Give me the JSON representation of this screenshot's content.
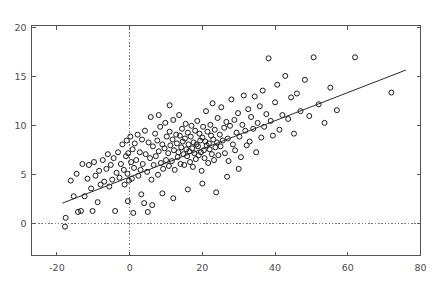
{
  "chart_data": {
    "type": "scatter",
    "title": "",
    "subtitle": "",
    "xlabel": "",
    "ylabel": "",
    "xlim": [
      -27,
      80
    ],
    "ylim": [
      -3.3,
      20.2
    ],
    "xticks": [
      -20,
      0,
      20,
      40,
      60,
      80
    ],
    "yticks": [
      0,
      5,
      10,
      15,
      20
    ],
    "xtick_labels": [
      "-20",
      "0",
      "20",
      "40",
      "60",
      "80"
    ],
    "ytick_labels": [
      "0",
      "5",
      "10",
      "15",
      "20"
    ],
    "grid": false,
    "legend": null,
    "legend_position": "none",
    "marker_style": "open-circle",
    "marker_color": "#1a1a1a",
    "background_color": "#ffffff",
    "axis_color": "#555555",
    "reference_lines": [
      {
        "name": "x-zero-line",
        "orientation": "vertical",
        "value": 0,
        "style": "dotted",
        "color": "#777777"
      },
      {
        "name": "y-zero-line",
        "orientation": "horizontal",
        "value": 0,
        "style": "dotted",
        "color": "#777777"
      }
    ],
    "fit_line": {
      "name": "regression-line",
      "x": [
        -18.5,
        76.0
      ],
      "y": [
        2.05,
        15.65
      ],
      "slope": 0.1438,
      "intercept": 4.71,
      "color": "#2b2b2b"
    },
    "points": [
      [
        -17.8,
        -0.35
      ],
      [
        -17.6,
        0.55
      ],
      [
        -16.2,
        4.35
      ],
      [
        -15.4,
        2.75
      ],
      [
        -14.6,
        5.05
      ],
      [
        -14.2,
        1.15
      ],
      [
        -13.4,
        1.25
      ],
      [
        -13.0,
        6.05
      ],
      [
        -12.4,
        2.75
      ],
      [
        -11.6,
        4.55
      ],
      [
        -11.2,
        5.95
      ],
      [
        -10.6,
        3.55
      ],
      [
        -10.2,
        1.25
      ],
      [
        -9.8,
        6.25
      ],
      [
        -9.4,
        4.85
      ],
      [
        -8.8,
        2.15
      ],
      [
        -8.4,
        5.35
      ],
      [
        -8.0,
        3.95
      ],
      [
        -7.4,
        6.45
      ],
      [
        -7.0,
        4.25
      ],
      [
        -6.4,
        5.55
      ],
      [
        -6.0,
        7.05
      ],
      [
        -5.6,
        3.75
      ],
      [
        -5.2,
        5.95
      ],
      [
        -4.8,
        4.45
      ],
      [
        -4.4,
        6.65
      ],
      [
        -4.0,
        1.25
      ],
      [
        -3.6,
        5.15
      ],
      [
        -3.2,
        7.25
      ],
      [
        -2.8,
        4.65
      ],
      [
        -2.4,
        6.05
      ],
      [
        -2.0,
        8.05
      ],
      [
        -1.6,
        5.45
      ],
      [
        -1.4,
        3.95
      ],
      [
        -1.0,
        6.85
      ],
      [
        -0.8,
        8.45
      ],
      [
        -0.6,
        5.05
      ],
      [
        -0.4,
        7.15
      ],
      [
        -0.2,
        4.35
      ],
      [
        0.2,
        8.85
      ],
      [
        0.4,
        6.25
      ],
      [
        0.6,
        4.55
      ],
      [
        0.8,
        7.55
      ],
      [
        1.2,
        5.65
      ],
      [
        1.4,
        8.15
      ],
      [
        1.8,
        6.45
      ],
      [
        2.2,
        9.05
      ],
      [
        2.4,
        4.85
      ],
      [
        2.8,
        7.25
      ],
      [
        3.0,
        5.45
      ],
      [
        3.4,
        8.55
      ],
      [
        3.6,
        6.05
      ],
      [
        4.0,
        2.05
      ],
      [
        4.2,
        9.45
      ],
      [
        4.4,
        7.05
      ],
      [
        4.8,
        5.25
      ],
      [
        5.0,
        1.15
      ],
      [
        5.2,
        8.25
      ],
      [
        5.6,
        6.65
      ],
      [
        5.8,
        10.85
      ],
      [
        6.0,
        4.45
      ],
      [
        6.4,
        7.85
      ],
      [
        6.6,
        5.95
      ],
      [
        7.0,
        9.15
      ],
      [
        7.2,
        6.85
      ],
      [
        7.6,
        8.45
      ],
      [
        7.8,
        4.95
      ],
      [
        8.0,
        7.35
      ],
      [
        8.4,
        9.85
      ],
      [
        8.6,
        6.15
      ],
      [
        9.0,
        8.05
      ],
      [
        9.2,
        5.55
      ],
      [
        9.6,
        7.65
      ],
      [
        9.8,
        10.25
      ],
      [
        10.0,
        6.45
      ],
      [
        10.2,
        8.85
      ],
      [
        10.6,
        7.15
      ],
      [
        10.8,
        5.85
      ],
      [
        11.0,
        9.35
      ],
      [
        11.2,
        7.95
      ],
      [
        11.6,
        6.35
      ],
      [
        11.8,
        8.55
      ],
      [
        12.0,
        10.55
      ],
      [
        12.2,
        7.45
      ],
      [
        12.4,
        5.45
      ],
      [
        12.8,
        9.05
      ],
      [
        13.0,
        8.15
      ],
      [
        13.2,
        6.75
      ],
      [
        13.4,
        7.25
      ],
      [
        13.6,
        11.05
      ],
      [
        13.8,
        8.95
      ],
      [
        14.0,
        6.05
      ],
      [
        14.2,
        7.75
      ],
      [
        14.4,
        9.65
      ],
      [
        14.6,
        8.35
      ],
      [
        14.8,
        7.05
      ],
      [
        15.0,
        5.95
      ],
      [
        15.2,
        8.65
      ],
      [
        15.4,
        10.15
      ],
      [
        15.6,
        7.55
      ],
      [
        15.8,
        6.85
      ],
      [
        16.0,
        9.25
      ],
      [
        16.2,
        8.05
      ],
      [
        16.4,
        7.35
      ],
      [
        16.6,
        6.25
      ],
      [
        16.8,
        8.85
      ],
      [
        17.0,
        9.95
      ],
      [
        17.2,
        7.65
      ],
      [
        17.4,
        5.75
      ],
      [
        17.6,
        8.25
      ],
      [
        17.8,
        7.15
      ],
      [
        18.0,
        9.45
      ],
      [
        18.2,
        6.55
      ],
      [
        18.4,
        8.05
      ],
      [
        18.6,
        10.45
      ],
      [
        18.8,
        7.85
      ],
      [
        19.0,
        6.95
      ],
      [
        19.2,
        9.15
      ],
      [
        19.4,
        8.45
      ],
      [
        19.6,
        7.25
      ],
      [
        19.8,
        5.35
      ],
      [
        20.0,
        8.75
      ],
      [
        20.2,
        9.85
      ],
      [
        20.4,
        7.45
      ],
      [
        20.6,
        6.65
      ],
      [
        20.8,
        8.35
      ],
      [
        21.0,
        11.45
      ],
      [
        21.2,
        7.95
      ],
      [
        21.4,
        9.35
      ],
      [
        21.6,
        6.15
      ],
      [
        21.8,
        8.15
      ],
      [
        22.0,
        7.55
      ],
      [
        22.2,
        10.05
      ],
      [
        22.4,
        8.95
      ],
      [
        22.6,
        7.05
      ],
      [
        22.8,
        12.25
      ],
      [
        23.0,
        8.55
      ],
      [
        23.2,
        6.45
      ],
      [
        23.4,
        9.55
      ],
      [
        23.6,
        7.75
      ],
      [
        24.0,
        8.25
      ],
      [
        24.2,
        10.75
      ],
      [
        24.4,
        6.95
      ],
      [
        24.8,
        9.05
      ],
      [
        25.0,
        7.85
      ],
      [
        25.2,
        11.85
      ],
      [
        25.6,
        8.45
      ],
      [
        26.0,
        9.75
      ],
      [
        26.2,
        7.15
      ],
      [
        26.6,
        10.35
      ],
      [
        27.0,
        8.65
      ],
      [
        27.2,
        6.35
      ],
      [
        27.6,
        9.95
      ],
      [
        28.0,
        12.65
      ],
      [
        28.4,
        8.05
      ],
      [
        28.8,
        10.55
      ],
      [
        29.0,
        7.45
      ],
      [
        29.4,
        9.25
      ],
      [
        29.8,
        11.25
      ],
      [
        30.2,
        8.85
      ],
      [
        30.6,
        6.75
      ],
      [
        31.0,
        10.05
      ],
      [
        31.4,
        13.05
      ],
      [
        31.8,
        9.45
      ],
      [
        32.2,
        7.95
      ],
      [
        32.6,
        11.65
      ],
      [
        33.0,
        8.35
      ],
      [
        33.4,
        10.85
      ],
      [
        34.0,
        9.65
      ],
      [
        34.4,
        12.95
      ],
      [
        34.8,
        7.25
      ],
      [
        35.2,
        10.25
      ],
      [
        35.8,
        11.95
      ],
      [
        36.2,
        8.75
      ],
      [
        36.6,
        13.55
      ],
      [
        37.0,
        9.85
      ],
      [
        37.6,
        11.15
      ],
      [
        38.2,
        16.85
      ],
      [
        38.8,
        10.45
      ],
      [
        39.4,
        8.95
      ],
      [
        40.0,
        12.35
      ],
      [
        40.6,
        14.15
      ],
      [
        41.2,
        9.55
      ],
      [
        42.0,
        11.05
      ],
      [
        42.8,
        15.05
      ],
      [
        43.6,
        10.65
      ],
      [
        44.4,
        12.85
      ],
      [
        45.2,
        9.15
      ],
      [
        46.0,
        13.25
      ],
      [
        47.0,
        11.45
      ],
      [
        48.2,
        14.65
      ],
      [
        49.4,
        10.95
      ],
      [
        50.6,
        16.95
      ],
      [
        52.0,
        12.15
      ],
      [
        53.6,
        10.25
      ],
      [
        55.2,
        13.85
      ],
      [
        57.0,
        11.55
      ],
      [
        62.0,
        16.95
      ],
      [
        72.0,
        13.35
      ],
      [
        30.0,
        5.55
      ],
      [
        26.8,
        4.75
      ],
      [
        23.8,
        3.15
      ],
      [
        20.0,
        4.05
      ],
      [
        16.0,
        3.45
      ],
      [
        12.0,
        2.55
      ],
      [
        9.0,
        3.05
      ],
      [
        6.2,
        1.85
      ],
      [
        3.2,
        2.95
      ],
      [
        1.0,
        1.05
      ],
      [
        -0.5,
        2.25
      ],
      [
        8.0,
        11.05
      ],
      [
        11.0,
        12.05
      ]
    ]
  }
}
